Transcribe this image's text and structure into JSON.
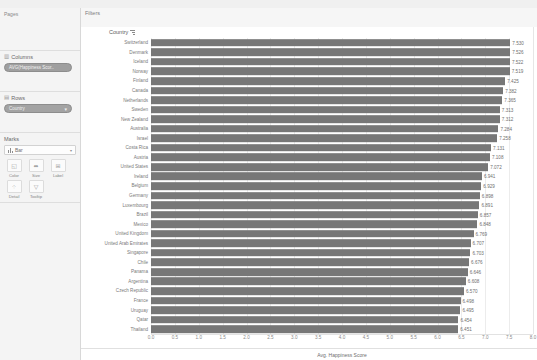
{
  "left_panel": {
    "pages": {
      "title": "Pages"
    },
    "columns": {
      "title": "Columns",
      "icon": "columns-icon",
      "pill_label": "AVG(Happiness Scor..",
      "pill_caret": "▾"
    },
    "rows": {
      "title": "Rows",
      "icon": "rows-icon",
      "pill_label": "Country",
      "pill_caret": "▾"
    },
    "marks": {
      "title": "Marks",
      "mark_type": "Bar",
      "caret": "▾",
      "buttons": [
        {
          "label": "Color",
          "icon": "color-icon",
          "glyph": "◱"
        },
        {
          "label": "Size",
          "icon": "size-icon",
          "glyph": "⬌"
        },
        {
          "label": "Label",
          "icon": "label-icon",
          "glyph": "⊞"
        },
        {
          "label": "Detail",
          "icon": "detail-icon",
          "glyph": "⁘"
        },
        {
          "label": "Tooltip",
          "icon": "tooltip-icon",
          "glyph": "▽"
        }
      ]
    }
  },
  "view": {
    "filters_label": "Filters",
    "column_header": "Country",
    "sort_icon": "sort-descending-icon"
  },
  "chart_data": {
    "type": "bar",
    "orientation": "horizontal",
    "title": "",
    "xlabel": "Avg. Happiness Score",
    "ylabel": "Country",
    "xlim": [
      0,
      8.0
    ],
    "xticks": [
      "0.0",
      "0.5",
      "1.0",
      "1.5",
      "2.0",
      "2.5",
      "3.0",
      "3.5",
      "4.0",
      "4.5",
      "5.0",
      "5.5",
      "6.0",
      "6.5",
      "7.0",
      "7.5",
      "8.0"
    ],
    "grid": true,
    "legend": "none",
    "bar_color": "#777777",
    "categories": [
      "Switzerland",
      "Denmark",
      "Iceland",
      "Norway",
      "Finland",
      "Canada",
      "Netherlands",
      "Sweden",
      "New Zealand",
      "Australia",
      "Israel",
      "Costa Rica",
      "Austria",
      "United States",
      "Ireland",
      "Belgium",
      "Germany",
      "Luxembourg",
      "Brazil",
      "Mexico",
      "United Kingdom",
      "United Arab Emirates",
      "Singapore",
      "Chile",
      "Panama",
      "Argentina",
      "Czech Republic",
      "France",
      "Uruguay",
      "Qatar",
      "Thailand"
    ],
    "values": [
      7.53,
      7.526,
      7.522,
      7.519,
      7.425,
      7.382,
      7.365,
      7.313,
      7.312,
      7.284,
      7.258,
      7.131,
      7.108,
      7.072,
      6.941,
      6.929,
      6.898,
      6.891,
      6.857,
      6.848,
      6.769,
      6.707,
      6.703,
      6.676,
      6.646,
      6.608,
      6.57,
      6.498,
      6.495,
      6.454,
      6.451
    ],
    "value_labels": [
      "7.530",
      "7.526",
      "7.522",
      "7.519",
      "7.425",
      "7.382",
      "7.365",
      "7.313",
      "7.312",
      "7.284",
      "7.258",
      "7.131",
      "7.108",
      "7.072",
      "6.941",
      "6.929",
      "6.898",
      "6.891",
      "6.857",
      "6.848",
      "6.769",
      "6.707",
      "6.703",
      "6.676",
      "6.646",
      "6.608",
      "6.570",
      "6.498",
      "6.495",
      "6.454",
      "6.451"
    ]
  }
}
